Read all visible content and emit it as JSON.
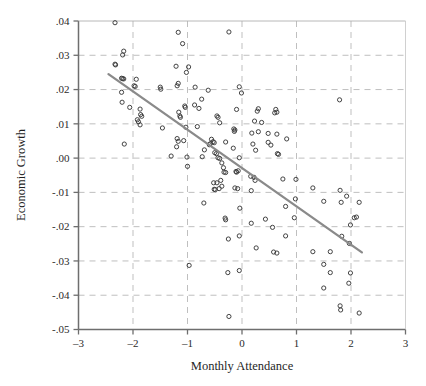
{
  "chart_data": {
    "type": "scatter",
    "title": "",
    "xlabel": "Monthly Attendance",
    "ylabel": "Economic Growth",
    "xlim": [
      -3,
      3
    ],
    "ylim": [
      -0.05,
      0.04
    ],
    "xticks": [
      -3,
      -2,
      -1,
      0,
      1,
      2,
      3
    ],
    "xtick_labels": [
      "–3",
      "–2",
      "–1",
      "0",
      "1",
      "2",
      "3"
    ],
    "yticks": [
      0.04,
      0.03,
      0.02,
      0.01,
      0.0,
      -0.01,
      -0.02,
      -0.03,
      -0.04,
      -0.05
    ],
    "ytick_labels": [
      ".04",
      ".03",
      ".02",
      ".01",
      ".00",
      "-.01",
      "-.02",
      "-.03",
      "-.04",
      "-.05"
    ],
    "grid": "dashed-gray",
    "legend": "none",
    "marker": "open-circle",
    "marker_color": "#3a3a3a",
    "marker_size": 4.2,
    "line_color": "#8a8a8a",
    "axis_color": "#6e6e6e",
    "grid_color": "#b8b8b8",
    "fit_line": {
      "type": "linear",
      "x_start": -2.45,
      "y_start": 0.0245,
      "x_end": 2.2,
      "y_end": -0.0275
    },
    "points": [
      [
        -2.33,
        0.0395
      ],
      [
        -1.17,
        0.0367
      ],
      [
        -0.24,
        0.0368
      ],
      [
        -1.09,
        0.0334
      ],
      [
        -2.17,
        0.0312
      ],
      [
        -2.19,
        0.0301
      ],
      [
        -2.33,
        0.0274
      ],
      [
        -2.32,
        0.0272
      ],
      [
        -1.21,
        0.0268
      ],
      [
        -0.98,
        0.0266
      ],
      [
        -1.02,
        0.025
      ],
      [
        -2.21,
        0.0233
      ],
      [
        -2.19,
        0.0232
      ],
      [
        -2.17,
        0.0231
      ],
      [
        -1.94,
        0.023
      ],
      [
        -1.98,
        0.0211
      ],
      [
        -1.96,
        0.0209
      ],
      [
        -1.17,
        0.0218
      ],
      [
        -1.19,
        0.0211
      ],
      [
        -1.5,
        0.0207
      ],
      [
        -1.49,
        0.0201
      ],
      [
        -0.86,
        0.0207
      ],
      [
        -0.62,
        0.0198
      ],
      [
        -0.05,
        0.0208
      ],
      [
        -0.01,
        0.019
      ],
      [
        -2.21,
        0.0192
      ],
      [
        -0.74,
        0.0172
      ],
      [
        1.79,
        0.017
      ],
      [
        -2.2,
        0.0163
      ],
      [
        -1.05,
        0.0152
      ],
      [
        -1.04,
        0.0148
      ],
      [
        -0.79,
        0.0145
      ],
      [
        -2.06,
        0.0148
      ],
      [
        -1.87,
        0.0143
      ],
      [
        -0.87,
        0.0155
      ],
      [
        -0.1,
        0.0142
      ],
      [
        0.3,
        0.0144
      ],
      [
        0.28,
        0.0137
      ],
      [
        0.62,
        0.0142
      ],
      [
        0.64,
        0.0134
      ],
      [
        0.6,
        0.0132
      ],
      [
        -1.86,
        0.0127
      ],
      [
        -1.84,
        0.0122
      ],
      [
        -1.16,
        0.0134
      ],
      [
        -1.14,
        0.0123
      ],
      [
        -1.13,
        0.0119
      ],
      [
        -0.46,
        0.0123
      ],
      [
        -0.44,
        0.0119
      ],
      [
        -1.92,
        0.0112
      ],
      [
        -1.9,
        0.0106
      ],
      [
        -1.87,
        0.0097
      ],
      [
        -0.41,
        0.0103
      ],
      [
        0.23,
        0.0108
      ],
      [
        0.36,
        0.0104
      ],
      [
        -1.46,
        0.0088
      ],
      [
        -1.03,
        0.009
      ],
      [
        -0.82,
        0.0092
      ],
      [
        -0.15,
        0.0085
      ],
      [
        -0.13,
        0.0082
      ],
      [
        -0.14,
        0.0078
      ],
      [
        0.18,
        0.0073
      ],
      [
        0.3,
        0.0077
      ],
      [
        0.48,
        0.0072
      ],
      [
        0.64,
        0.007
      ],
      [
        -2.16,
        0.0041
      ],
      [
        -1.19,
        0.0057
      ],
      [
        -1.17,
        0.0049
      ],
      [
        -1.07,
        0.0051
      ],
      [
        -0.56,
        0.0055
      ],
      [
        -0.53,
        0.0048
      ],
      [
        -0.51,
        0.0045
      ],
      [
        -0.58,
        0.0042
      ],
      [
        -0.6,
        0.0039
      ],
      [
        -0.3,
        0.0047
      ],
      [
        0.2,
        0.0041
      ],
      [
        0.48,
        0.0046
      ],
      [
        0.53,
        0.0038
      ],
      [
        0.82,
        0.0056
      ],
      [
        -1.2,
        0.0033
      ],
      [
        -0.69,
        0.0024
      ],
      [
        -0.5,
        0.0016
      ],
      [
        -0.47,
        0.0013
      ],
      [
        -0.16,
        0.0029
      ],
      [
        0.25,
        0.0023
      ],
      [
        0.65,
        0.0013
      ],
      [
        0.67,
        0.0011
      ],
      [
        -1.3,
        0.0006
      ],
      [
        -1.01,
        0.0003
      ],
      [
        -0.73,
        0.0004
      ],
      [
        -0.44,
        0.0001
      ],
      [
        -0.41,
        -0.0001
      ],
      [
        -0.05,
        0.0001
      ],
      [
        -1.0,
        -0.0024
      ],
      [
        -0.37,
        -0.0014
      ],
      [
        -0.34,
        -0.0028
      ],
      [
        -0.33,
        -0.0041
      ],
      [
        -0.3,
        -0.0042
      ],
      [
        -0.11,
        -0.0039
      ],
      [
        -0.07,
        -0.0037
      ],
      [
        -0.1,
        -0.0041
      ],
      [
        0.16,
        -0.0053
      ],
      [
        0.22,
        -0.0056
      ],
      [
        0.24,
        -0.0065
      ],
      [
        0.75,
        -0.0061
      ],
      [
        0.99,
        -0.0062
      ],
      [
        -0.52,
        -0.0072
      ],
      [
        -0.46,
        -0.0072
      ],
      [
        -0.39,
        -0.0065
      ],
      [
        -0.37,
        -0.0082
      ],
      [
        -0.51,
        -0.0091
      ],
      [
        -0.49,
        -0.0092
      ],
      [
        -0.42,
        -0.0089
      ],
      [
        -0.13,
        -0.0087
      ],
      [
        -0.08,
        -0.0089
      ],
      [
        0.17,
        -0.0095
      ],
      [
        1.3,
        -0.0087
      ],
      [
        1.8,
        -0.0094
      ],
      [
        1.92,
        -0.0111
      ],
      [
        2.15,
        -0.0129
      ],
      [
        0.98,
        -0.0119
      ],
      [
        -0.7,
        -0.0131
      ],
      [
        -0.04,
        -0.0146
      ],
      [
        0.8,
        -0.0141
      ],
      [
        1.5,
        -0.0126
      ],
      [
        1.82,
        -0.0129
      ],
      [
        -0.31,
        -0.0175
      ],
      [
        -0.3,
        -0.018
      ],
      [
        0.43,
        -0.0178
      ],
      [
        0.96,
        -0.0174
      ],
      [
        2.1,
        -0.0172
      ],
      [
        2.06,
        -0.0174
      ],
      [
        0.17,
        -0.019
      ],
      [
        0.56,
        -0.0202
      ],
      [
        1.99,
        -0.0195
      ],
      [
        -0.05,
        -0.0227
      ],
      [
        -0.25,
        -0.0236
      ],
      [
        0.8,
        -0.0227
      ],
      [
        1.83,
        -0.0228
      ],
      [
        1.97,
        -0.0249
      ],
      [
        0.26,
        -0.0262
      ],
      [
        1.3,
        -0.0273
      ],
      [
        1.62,
        -0.0273
      ],
      [
        0.58,
        -0.0274
      ],
      [
        0.64,
        -0.0277
      ],
      [
        -0.97,
        -0.0313
      ],
      [
        -0.26,
        -0.0334
      ],
      [
        -0.05,
        -0.0328
      ],
      [
        1.5,
        -0.031
      ],
      [
        1.62,
        -0.0334
      ],
      [
        1.99,
        -0.0335
      ],
      [
        1.96,
        -0.0365
      ],
      [
        1.5,
        -0.0379
      ],
      [
        1.8,
        -0.0431
      ],
      [
        1.81,
        -0.0443
      ],
      [
        2.15,
        -0.0452
      ],
      [
        -0.24,
        -0.0462
      ]
    ]
  }
}
